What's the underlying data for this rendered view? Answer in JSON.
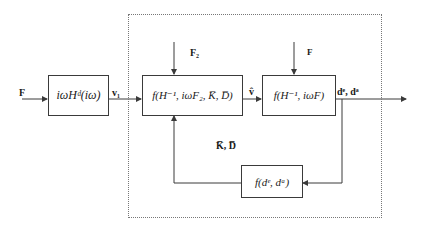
{
  "diagram": {
    "type": "block-diagram",
    "frame": {
      "style": "dotted"
    },
    "blocks": [
      {
        "id": "b1",
        "label": "iωH_d(iω)",
        "text": "iωHᵈ(iω)"
      },
      {
        "id": "b2",
        "label": "f(H⁻¹, iωF₂, K̄, D̄)",
        "text": "f(H⁻¹, iωF₂, K̅, D̅)"
      },
      {
        "id": "b3",
        "label": "f(H⁻¹, iωF)",
        "text": "f(H⁻¹, iωF)"
      },
      {
        "id": "b4",
        "label": "f(dᵉ, dᵃ)",
        "text": "f(dᵉ, dᵃ)"
      }
    ],
    "signals": {
      "input": "F",
      "v1": "v₁",
      "F2": "F₂",
      "F": "F",
      "vhat": "v̂",
      "output": "dᵉ, dᵃ",
      "feedback": "K̅, D̅"
    },
    "edges": [
      {
        "from": "input",
        "to": "b1",
        "label": "F"
      },
      {
        "from": "b1",
        "to": "b2",
        "label": "v₁"
      },
      {
        "from": "F2",
        "to": "b2",
        "label": "F₂"
      },
      {
        "from": "b2",
        "to": "b3",
        "label": "v̂"
      },
      {
        "from": "F",
        "to": "b3",
        "label": "F"
      },
      {
        "from": "b3",
        "to": "output",
        "label": "dᵉ, dᵃ"
      },
      {
        "from": "b3",
        "to": "b4",
        "label": ""
      },
      {
        "from": "b4",
        "to": "b2",
        "label": "K̄, D̄"
      }
    ],
    "colors": {
      "line": "#3a3a3a",
      "frame": "#777777",
      "background": "#ffffff"
    }
  }
}
